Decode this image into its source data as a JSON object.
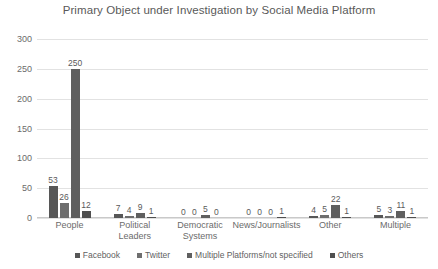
{
  "chart_data": {
    "type": "bar",
    "title": "Primary Object under Investigation by Social Media Platform",
    "xlabel": "",
    "ylabel": "",
    "ylim": [
      0,
      300
    ],
    "yticks": [
      0,
      50,
      100,
      150,
      200,
      250,
      300
    ],
    "grid": true,
    "legend_position": "bottom",
    "categories": [
      "People",
      "Political Leaders",
      "Democratic Systems",
      "News/Journalists",
      "Other",
      "Multiple"
    ],
    "series": [
      {
        "name": "Facebook",
        "color": "#575757",
        "values": [
          53,
          7,
          0,
          0,
          4,
          5
        ]
      },
      {
        "name": "Twitter",
        "color": "#6e6e6e",
        "values": [
          26,
          4,
          0,
          0,
          5,
          3
        ]
      },
      {
        "name": "Multiple Platforms/not specified",
        "color": "#5f5f5f",
        "values": [
          250,
          9,
          5,
          0,
          22,
          11
        ]
      },
      {
        "name": "Others",
        "color": "#4f4f4f",
        "values": [
          12,
          1,
          0,
          1,
          1,
          1
        ]
      }
    ]
  },
  "colors": {
    "background": "#ffffff",
    "gridline": "#e2e2e2",
    "axis": "#c9c9c9",
    "text": "#6b6b6b",
    "title_text": "#595959"
  }
}
